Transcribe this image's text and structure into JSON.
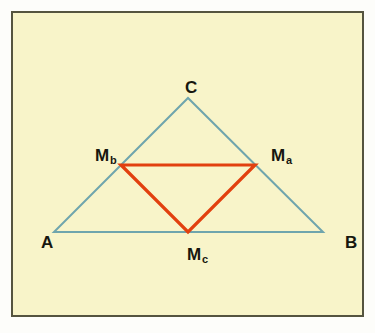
{
  "figure": {
    "background_color": "#f8f4c9",
    "border_color": "#55543f",
    "page_color": "#fdfdfa",
    "outer_triangle_color": "#6fa5ad",
    "medial_triangle_color": "#e2400f",
    "label_color": "#17170f",
    "labels": {
      "vertex_a": "A",
      "vertex_b": "B",
      "vertex_c": "C",
      "midpoint_a_main": "M",
      "midpoint_a_sub": "a",
      "midpoint_b_main": "M",
      "midpoint_b_sub": "b",
      "midpoint_c_main": "M",
      "midpoint_c_sub": "c"
    }
  },
  "chart_data": {
    "type": "scatter",
    "title": "",
    "subtitle": "",
    "xlabel": "",
    "ylabel": "",
    "grid": false,
    "legend_position": "none",
    "xlim": [
      0,
      353
    ],
    "ylim": [
      0,
      306
    ],
    "annotations": [
      {
        "text": "C",
        "x": 178,
        "y": 85
      },
      {
        "text": "Mb",
        "x": 90,
        "y": 152
      },
      {
        "text": "Ma",
        "x": 266,
        "y": 152
      },
      {
        "text": "A",
        "x": 34,
        "y": 239
      },
      {
        "text": "B",
        "x": 338,
        "y": 239
      },
      {
        "text": "Mc",
        "x": 182,
        "y": 251
      }
    ],
    "series": [
      {
        "name": "outer triangle ABC",
        "type": "polygon",
        "color": "#6fa5ad",
        "linewidth": 2,
        "points": [
          {
            "label": "A",
            "x": 41,
            "y": 219
          },
          {
            "label": "B",
            "x": 310,
            "y": 219
          },
          {
            "label": "C",
            "x": 175,
            "y": 85
          }
        ]
      },
      {
        "name": "medial triangle MaMbMc",
        "type": "polygon",
        "color": "#e2400f",
        "linewidth": 3,
        "points": [
          {
            "label": "Mb",
            "x": 108,
            "y": 152
          },
          {
            "label": "Ma",
            "x": 242,
            "y": 152
          },
          {
            "label": "Mc",
            "x": 175,
            "y": 219
          }
        ]
      }
    ]
  }
}
